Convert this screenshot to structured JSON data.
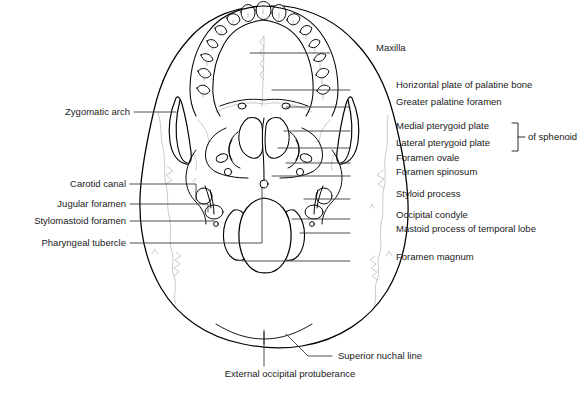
{
  "figure": {
    "ink_color": "#000000",
    "suture_color": "#b0b0b0",
    "leader_color": "#3a3a3a",
    "background": "#ffffff"
  },
  "labels": {
    "right": [
      {
        "id": "maxilla",
        "text": "Maxilla",
        "x": 376,
        "y": 48,
        "leader_y": 53,
        "leader_x1": 330,
        "leader_x2": 250
      },
      {
        "id": "horizontal-plate-of-palatine-bone",
        "text": "Horizontal plate of palatine bone",
        "x": 396,
        "y": 85,
        "leader_y": 90,
        "leader_x1": 350,
        "leader_x2": 272
      },
      {
        "id": "greater-palatine-foramen",
        "text": "Greater palatine foramen",
        "x": 396,
        "y": 102,
        "leader_y": 107,
        "leader_x1": 350,
        "leader_x2": 286
      },
      {
        "id": "medial-pterygoid-plate",
        "text": "Medial pterygoid plate",
        "x": 396,
        "y": 126,
        "leader_y": 131,
        "leader_x1": 350,
        "leader_x2": 284
      },
      {
        "id": "lateral-pterygoid-plate",
        "text": "Lateral pterygoid plate",
        "x": 396,
        "y": 143,
        "leader_y": 148,
        "leader_x1": 350,
        "leader_x2": 278
      },
      {
        "id": "foramen-ovale",
        "text": "Foramen ovale",
        "x": 396,
        "y": 158,
        "leader_y": 163,
        "leader_x1": 350,
        "leader_x2": 286
      },
      {
        "id": "foramen-spinosum",
        "text": "Foramen spinosum",
        "x": 396,
        "y": 172,
        "leader_y": 176,
        "leader_x1": 350,
        "leader_x2": 272
      },
      {
        "id": "styloid-process",
        "text": "Styloid process",
        "x": 396,
        "y": 194,
        "leader_y": 199,
        "leader_x1": 350,
        "leader_x2": 304
      },
      {
        "id": "occipital-condyle",
        "text": "Occipital condyle",
        "x": 396,
        "y": 215,
        "leader_y": 219,
        "leader_x1": 350,
        "leader_x2": 292
      },
      {
        "id": "mastoid-process-of-temporal-lobe",
        "text": "Mastoid process of temporal lobe",
        "x": 396,
        "y": 229,
        "leader_y": 233,
        "leader_x1": 350,
        "leader_x2": 300
      },
      {
        "id": "foramen-magnum",
        "text": "Foramen magnum",
        "x": 396,
        "y": 257,
        "leader_y": 261,
        "leader_x1": 350,
        "leader_x2": 242
      }
    ],
    "left": [
      {
        "id": "zygomatic-arch",
        "text": "Zygomatic arch",
        "x": 44,
        "y": 107,
        "leader_y": 112,
        "leader_x1": 134,
        "leader_x2": 176,
        "drop_to": 112
      },
      {
        "id": "carotid-canal",
        "text": "Carotid canal",
        "x": 52,
        "y": 179,
        "leader_y": 184,
        "leader_x1": 130,
        "leader_x2": 196,
        "drop_to": 196
      },
      {
        "id": "jugular-foramen",
        "text": "Jugular foramen",
        "x": 36,
        "y": 199,
        "leader_y": 204,
        "leader_x1": 130,
        "leader_x2": 208,
        "drop_to": 211
      },
      {
        "id": "stylomastoid-foramen",
        "text": "Stylomastoid foramen",
        "x": 10,
        "y": 216,
        "leader_y": 221,
        "leader_x1": 130,
        "leader_x2": 214,
        "drop_to": 221
      },
      {
        "id": "pharyngeal-tubercle",
        "text": "Pharyngeal tubercle",
        "x": 18,
        "y": 239,
        "leader_y": 243,
        "leader_x1": 130,
        "leader_x2": 262,
        "drop_to": 243
      }
    ],
    "bottom": [
      {
        "id": "superior-nuchal-line",
        "text": "Superior nuchal line",
        "x": 338,
        "y": 352
      },
      {
        "id": "external-occipital-protuberance",
        "text": "External occipital protuberance",
        "x": 243,
        "y": 374,
        "width": 94
      }
    ],
    "bracket": {
      "id": "of-sphenoid",
      "text": "of sphenoid",
      "x": 528,
      "y": 134,
      "top_y": 123,
      "bottom_y": 151,
      "bracket_x": 518
    }
  },
  "structures": {
    "teeth_count_per_side": 8,
    "named_parts": [
      "cranium outline",
      "maxilla",
      "palatine bone",
      "zygomatic arch",
      "pterygoid plates",
      "foramen ovale",
      "foramen spinosum",
      "carotid canal",
      "jugular foramen",
      "stylomastoid foramen",
      "styloid process",
      "mastoid process",
      "occipital condyle",
      "foramen magnum",
      "superior nuchal line",
      "external occipital protuberance"
    ]
  }
}
